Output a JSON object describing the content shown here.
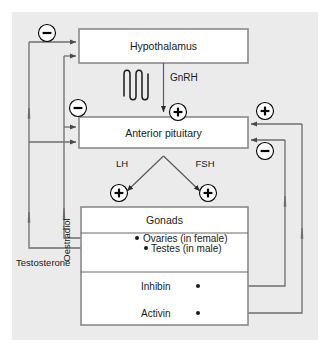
{
  "figure": {
    "background_color": "#ebebeb",
    "box_fill": "#ffffff",
    "box_stroke": "#8a8a8a",
    "line_color": "#5a5a5a"
  },
  "nodes": {
    "hypothalamus": {
      "label": "Hypothalamus"
    },
    "anterior_pituitary": {
      "label": "Anterior pituitary"
    },
    "gonads": {
      "label": "Gonads"
    },
    "ovaries": {
      "label": "Ovaries (in female)"
    },
    "testes": {
      "label": "Testes (in male)"
    },
    "inhibin": {
      "label": "Inhibin"
    },
    "activin": {
      "label": "Activin"
    }
  },
  "hormones": {
    "gnrh": "GnRH",
    "lh": "LH",
    "fsh": "FSH",
    "oestradiol": "Oestradiol",
    "testosterone": "Testosterone"
  },
  "signs": {
    "hypothalamus_feedback_negative": "−",
    "pituitary_feedback_negative": "−",
    "gnrh_positive": "+",
    "lh_positive": "+",
    "fsh_positive": "+",
    "activin_positive": "+",
    "inhibin_negative": "−"
  },
  "sign_names": {
    "minus": "minus-sign",
    "plus": "plus-sign"
  }
}
